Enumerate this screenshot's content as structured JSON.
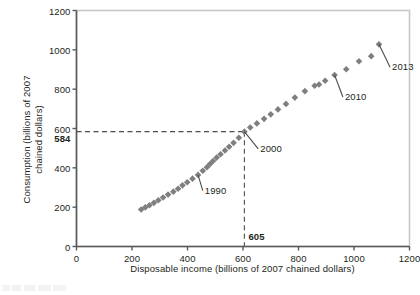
{
  "chart_data": {
    "type": "scatter",
    "title": "",
    "xlabel": "Disposable income (billions of 2007 chained dollars)",
    "ylabel": "Consumption (billions of 2007\nchained dollars)",
    "xlim": [
      0,
      1200
    ],
    "ylim": [
      0,
      1200
    ],
    "xticks": [
      0,
      200,
      400,
      600,
      800,
      1000,
      1200
    ],
    "ytick_labels": [
      "0",
      "200",
      "400",
      "600",
      "800",
      "1000",
      "1200"
    ],
    "xtick_labels": [
      "0",
      "200",
      "400",
      "600",
      "800",
      "1000",
      "1200"
    ],
    "yticks": [
      0,
      200,
      400,
      600,
      800,
      1000,
      1200
    ],
    "extra_ytick": {
      "value": 584,
      "label": "584"
    },
    "extra_xtick": {
      "value": 605,
      "label": "605"
    },
    "grid": false,
    "legend": null,
    "marker": "diamond",
    "marker_color": "#7f7f7f",
    "frame_color": "#c8c8c8",
    "axis_color": "#58595b",
    "guide_lines": [
      {
        "orientation": "horizontal",
        "value": 584,
        "style": "dashed",
        "from_x": 0,
        "to_x": 605
      },
      {
        "orientation": "vertical",
        "value": 605,
        "style": "dashed",
        "from_y": 0,
        "to_y": 584
      }
    ],
    "points": [
      {
        "x": 233,
        "y": 188
      },
      {
        "x": 248,
        "y": 199
      },
      {
        "x": 263,
        "y": 210
      },
      {
        "x": 279,
        "y": 222
      },
      {
        "x": 295,
        "y": 235
      },
      {
        "x": 312,
        "y": 249
      },
      {
        "x": 330,
        "y": 264
      },
      {
        "x": 349,
        "y": 279
      },
      {
        "x": 366,
        "y": 294
      },
      {
        "x": 382,
        "y": 311
      },
      {
        "x": 399,
        "y": 327
      },
      {
        "x": 418,
        "y": 345
      },
      {
        "x": 438,
        "y": 364
      },
      {
        "x": 455,
        "y": 385,
        "label": "1990"
      },
      {
        "x": 470,
        "y": 403
      },
      {
        "x": 481,
        "y": 419
      },
      {
        "x": 492,
        "y": 435
      },
      {
        "x": 505,
        "y": 452
      },
      {
        "x": 519,
        "y": 469
      },
      {
        "x": 535,
        "y": 488
      },
      {
        "x": 550,
        "y": 507
      },
      {
        "x": 566,
        "y": 527
      },
      {
        "x": 585,
        "y": 553
      },
      {
        "x": 605,
        "y": 584,
        "label": "2000"
      },
      {
        "x": 626,
        "y": 605
      },
      {
        "x": 650,
        "y": 626
      },
      {
        "x": 676,
        "y": 649
      },
      {
        "x": 700,
        "y": 672
      },
      {
        "x": 726,
        "y": 697
      },
      {
        "x": 755,
        "y": 725
      },
      {
        "x": 787,
        "y": 757
      },
      {
        "x": 823,
        "y": 790
      },
      {
        "x": 858,
        "y": 817
      },
      {
        "x": 874,
        "y": 824
      },
      {
        "x": 896,
        "y": 843
      },
      {
        "x": 930,
        "y": 872,
        "label": "2010"
      },
      {
        "x": 972,
        "y": 901
      },
      {
        "x": 1018,
        "y": 942
      },
      {
        "x": 1062,
        "y": 968
      },
      {
        "x": 1090,
        "y": 1028,
        "label": "2013"
      }
    ],
    "annotations": [
      {
        "text": "1990",
        "point_x": 438,
        "point_y": 364,
        "label_x": 455,
        "label_y": 284
      },
      {
        "text": "2000",
        "point_x": 605,
        "point_y": 584,
        "label_x": 655,
        "label_y": 496
      },
      {
        "text": "2010",
        "point_x": 930,
        "point_y": 872,
        "label_x": 960,
        "label_y": 760
      },
      {
        "text": "2013",
        "point_x": 1090,
        "point_y": 1028,
        "label_x": 1130,
        "label_y": 912
      }
    ]
  }
}
